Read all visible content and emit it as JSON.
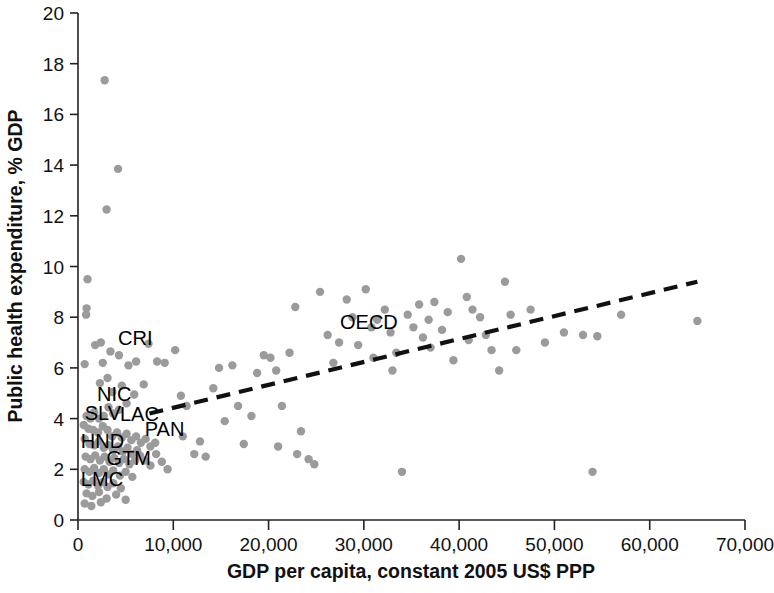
{
  "chart_data": {
    "type": "scatter",
    "title": "",
    "xlabel": "GDP per capita, constant 2005 US$ PPP",
    "ylabel": "Public health expenditure, % GDP",
    "xlim": [
      0,
      70000
    ],
    "ylim": [
      0,
      20
    ],
    "xticks": [
      0,
      10000,
      20000,
      30000,
      40000,
      50000,
      60000,
      70000
    ],
    "xticklabels": [
      "0",
      "10,000",
      "20,000",
      "30,000",
      "40,000",
      "50,000",
      "60,000",
      "70,000"
    ],
    "yticks": [
      0,
      2,
      4,
      6,
      8,
      10,
      12,
      14,
      16,
      18,
      20
    ],
    "yticklabels": [
      "0",
      "2",
      "4",
      "6",
      "8",
      "10",
      "12",
      "14",
      "16",
      "18",
      "20"
    ],
    "grid": false,
    "legend": "none",
    "point_color": "#9b9b9b",
    "trendline": {
      "label": "linear fit",
      "style": "dashed",
      "color": "#111111",
      "x": [
        7500,
        65000
      ],
      "y": [
        4.2,
        9.4
      ]
    },
    "annotations": [
      {
        "text": "CRI",
        "x": 4200,
        "y": 6.9
      },
      {
        "text": "NIC",
        "x": 2000,
        "y": 4.7
      },
      {
        "text": "SLV",
        "x": 700,
        "y": 3.95
      },
      {
        "text": "LAC",
        "x": 4400,
        "y": 3.9
      },
      {
        "text": "PAN",
        "x": 7000,
        "y": 3.3
      },
      {
        "text": "HND",
        "x": 300,
        "y": 2.85
      },
      {
        "text": "GTM",
        "x": 3000,
        "y": 2.15
      },
      {
        "text": "LMC",
        "x": 300,
        "y": 1.35
      },
      {
        "text": "OECD",
        "x": 27500,
        "y": 7.55
      }
    ],
    "points": [
      [
        2800,
        17.35
      ],
      [
        4200,
        13.85
      ],
      [
        3000,
        12.25
      ],
      [
        1000,
        9.5
      ],
      [
        900,
        8.35
      ],
      [
        850,
        8.1
      ],
      [
        700,
        6.15
      ],
      [
        2400,
        7.0
      ],
      [
        3400,
        6.65
      ],
      [
        4300,
        6.5
      ],
      [
        1800,
        6.9
      ],
      [
        2600,
        6.2
      ],
      [
        3100,
        5.6
      ],
      [
        2300,
        5.4
      ],
      [
        3600,
        5.05
      ],
      [
        4600,
        5.3
      ],
      [
        5300,
        6.1
      ],
      [
        6100,
        6.25
      ],
      [
        7400,
        6.95
      ],
      [
        8300,
        6.25
      ],
      [
        9100,
        6.2
      ],
      [
        6900,
        5.35
      ],
      [
        5900,
        4.95
      ],
      [
        5100,
        4.6
      ],
      [
        4300,
        4.35
      ],
      [
        3700,
        4.2
      ],
      [
        3200,
        4.45
      ],
      [
        2700,
        4.1
      ],
      [
        2200,
        4.0
      ],
      [
        1700,
        4.25
      ],
      [
        1300,
        4.0
      ],
      [
        900,
        4.1
      ],
      [
        600,
        3.75
      ],
      [
        1100,
        3.6
      ],
      [
        1600,
        3.55
      ],
      [
        2100,
        3.45
      ],
      [
        2600,
        3.7
      ],
      [
        3100,
        3.55
      ],
      [
        3600,
        3.3
      ],
      [
        4100,
        3.45
      ],
      [
        4600,
        3.25
      ],
      [
        5100,
        3.4
      ],
      [
        5600,
        3.15
      ],
      [
        6100,
        3.3
      ],
      [
        6600,
        3.05
      ],
      [
        7100,
        3.2
      ],
      [
        7600,
        2.9
      ],
      [
        8100,
        3.05
      ],
      [
        700,
        3.2
      ],
      [
        1200,
        3.0
      ],
      [
        1700,
        2.95
      ],
      [
        2200,
        3.1
      ],
      [
        2700,
        2.85
      ],
      [
        3200,
        2.95
      ],
      [
        3700,
        2.75
      ],
      [
        4200,
        2.9
      ],
      [
        4700,
        2.7
      ],
      [
        5200,
        2.85
      ],
      [
        5700,
        2.6
      ],
      [
        6200,
        2.75
      ],
      [
        800,
        2.5
      ],
      [
        1300,
        2.4
      ],
      [
        1800,
        2.55
      ],
      [
        2300,
        2.35
      ],
      [
        2800,
        2.5
      ],
      [
        3300,
        2.3
      ],
      [
        3800,
        2.45
      ],
      [
        4300,
        2.25
      ],
      [
        4800,
        2.4
      ],
      [
        5400,
        2.2
      ],
      [
        6000,
        2.35
      ],
      [
        700,
        2.0
      ],
      [
        1200,
        1.9
      ],
      [
        1700,
        2.05
      ],
      [
        2200,
        1.85
      ],
      [
        2700,
        2.0
      ],
      [
        3200,
        1.8
      ],
      [
        3700,
        1.95
      ],
      [
        4400,
        1.75
      ],
      [
        5000,
        1.9
      ],
      [
        5700,
        1.7
      ],
      [
        600,
        1.5
      ],
      [
        1100,
        1.4
      ],
      [
        1600,
        1.55
      ],
      [
        2100,
        1.35
      ],
      [
        2600,
        1.5
      ],
      [
        3100,
        1.3
      ],
      [
        3700,
        1.45
      ],
      [
        4500,
        1.25
      ],
      [
        900,
        1.05
      ],
      [
        1500,
        0.95
      ],
      [
        2200,
        1.1
      ],
      [
        3000,
        0.85
      ],
      [
        4000,
        1.0
      ],
      [
        5000,
        0.8
      ],
      [
        700,
        0.65
      ],
      [
        1400,
        0.55
      ],
      [
        2400,
        0.7
      ],
      [
        6500,
        2.55
      ],
      [
        7000,
        2.35
      ],
      [
        7600,
        2.15
      ],
      [
        8200,
        2.6
      ],
      [
        8800,
        2.3
      ],
      [
        9400,
        2.0
      ],
      [
        10200,
        6.7
      ],
      [
        10800,
        4.9
      ],
      [
        11400,
        4.5
      ],
      [
        11000,
        3.3
      ],
      [
        12200,
        2.6
      ],
      [
        12800,
        3.1
      ],
      [
        13400,
        2.5
      ],
      [
        14200,
        5.2
      ],
      [
        14800,
        6.0
      ],
      [
        15400,
        3.9
      ],
      [
        16200,
        6.1
      ],
      [
        16800,
        4.5
      ],
      [
        17400,
        3.0
      ],
      [
        18200,
        4.1
      ],
      [
        18800,
        5.8
      ],
      [
        19500,
        6.5
      ],
      [
        20200,
        6.4
      ],
      [
        20800,
        5.9
      ],
      [
        21400,
        4.5
      ],
      [
        21000,
        2.9
      ],
      [
        22200,
        6.6
      ],
      [
        22800,
        8.4
      ],
      [
        23400,
        3.5
      ],
      [
        23000,
        2.6
      ],
      [
        24200,
        2.4
      ],
      [
        24800,
        2.2
      ],
      [
        25400,
        9.0
      ],
      [
        26200,
        7.3
      ],
      [
        26800,
        6.2
      ],
      [
        27400,
        7.0
      ],
      [
        28200,
        8.7
      ],
      [
        28800,
        8.0
      ],
      [
        29400,
        6.9
      ],
      [
        30200,
        9.1
      ],
      [
        30800,
        7.6
      ],
      [
        31400,
        7.9
      ],
      [
        31000,
        6.4
      ],
      [
        32200,
        8.3
      ],
      [
        32800,
        7.4
      ],
      [
        33400,
        6.6
      ],
      [
        33000,
        5.9
      ],
      [
        34000,
        1.9
      ],
      [
        34600,
        8.1
      ],
      [
        35200,
        7.6
      ],
      [
        35800,
        8.5
      ],
      [
        36200,
        7.2
      ],
      [
        36800,
        7.9
      ],
      [
        37400,
        8.6
      ],
      [
        37000,
        6.8
      ],
      [
        38200,
        7.5
      ],
      [
        38800,
        8.2
      ],
      [
        39400,
        6.3
      ],
      [
        40200,
        10.3
      ],
      [
        40800,
        8.8
      ],
      [
        41400,
        8.3
      ],
      [
        41000,
        7.1
      ],
      [
        42200,
        8.0
      ],
      [
        42800,
        7.3
      ],
      [
        43400,
        6.7
      ],
      [
        44200,
        5.9
      ],
      [
        44800,
        9.4
      ],
      [
        45400,
        8.1
      ],
      [
        46000,
        6.7
      ],
      [
        47500,
        8.3
      ],
      [
        49000,
        7.0
      ],
      [
        51000,
        7.4
      ],
      [
        53000,
        7.3
      ],
      [
        54000,
        1.9
      ],
      [
        54500,
        7.25
      ],
      [
        57000,
        8.1
      ],
      [
        65000,
        7.85
      ]
    ]
  }
}
